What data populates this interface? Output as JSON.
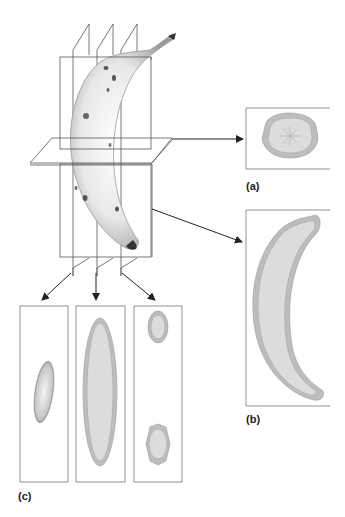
{
  "figure": {
    "labels": {
      "a": "(a)",
      "b": "(b)",
      "c": "(c)"
    },
    "colors": {
      "line": "#555555",
      "arrow": "#222222",
      "peel": "#bdbdbd",
      "peel_edge": "#9a9a9a",
      "flesh": "#dcdcdc",
      "banana_shade": "#8a8a8a",
      "background": "#ffffff"
    },
    "panels": [
      {
        "id": "a",
        "name": "transverse-section",
        "caption": "(a)"
      },
      {
        "id": "b",
        "name": "longitudinal-section",
        "caption": "(b)"
      },
      {
        "id": "c",
        "name": "serial-sections",
        "caption": "(c)",
        "count": 3
      }
    ]
  }
}
